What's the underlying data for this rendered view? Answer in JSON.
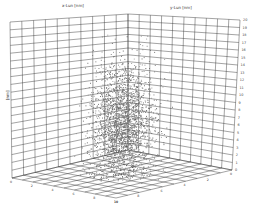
{
  "chart_data": {
    "type": "scatter",
    "subtype": "3d-scatter",
    "title": "",
    "xlabel": "x-Lun [nm]",
    "ylabel": "y-Lun [nm]",
    "zlabel": "[nm]",
    "zlim": [
      0,
      20
    ],
    "z_ticks": [
      0,
      1,
      2,
      3,
      4,
      5,
      6,
      7,
      8,
      9,
      10,
      11,
      12,
      13,
      14,
      15,
      16,
      17,
      18,
      19,
      20
    ],
    "x_ticks": [
      0,
      1,
      2,
      3,
      4,
      5,
      6,
      7,
      8,
      9,
      10
    ],
    "y_ticks": [
      0,
      1,
      2,
      3,
      4,
      5,
      6,
      7,
      8,
      9,
      10
    ],
    "grid": true,
    "legend": null,
    "point_color": "#555555",
    "n_points_approx": 2500
  },
  "labels": {
    "x_axis": "x-Lun [nm]",
    "y_axis": "y-Lun [nm]",
    "z_axis": "[nm]"
  }
}
